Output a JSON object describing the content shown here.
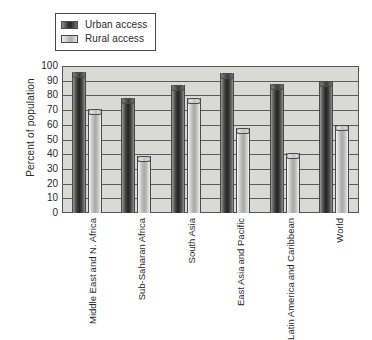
{
  "chart_data": {
    "type": "bar",
    "title": "",
    "subtitle": "",
    "xlabel": "",
    "ylabel": "Percent of population",
    "ylim": [
      0,
      100
    ],
    "ytick_step": 10,
    "yticks": [
      "100",
      "90",
      "80",
      "70",
      "60",
      "50",
      "40",
      "30",
      "20",
      "10",
      "0"
    ],
    "grid": true,
    "legend_position": "top-left",
    "categories": [
      "Middle East and N. Africa",
      "Sub-Saharan Africa",
      "South Asia",
      "East Asia and Pacific",
      "Latin America and Caribbean",
      "World"
    ],
    "category_label_lines": [
      [
        "Middle East",
        "and N. Africa"
      ],
      [
        "Sub-Saharan",
        "Africa"
      ],
      [
        "South Asia"
      ],
      [
        "East Asia",
        "and Pacific"
      ],
      [
        "Latin America",
        "and Caribbean"
      ],
      [
        "World"
      ]
    ],
    "series": [
      {
        "name": "Urban access",
        "color": "#2e2e2e",
        "values": [
          96,
          78,
          87,
          95,
          88,
          90
        ]
      },
      {
        "name": "Rural access",
        "color": "#c0c0c0",
        "values": [
          71,
          39,
          78,
          58,
          41,
          60
        ]
      }
    ]
  },
  "legend": {
    "items": [
      {
        "label": "Urban access",
        "swatch": "urban"
      },
      {
        "label": "Rural access",
        "swatch": "rural"
      }
    ]
  },
  "colors": {
    "plot_background": "#d9d9d5",
    "axis": "#555555",
    "gridline": "#5a5a5a",
    "page_background": "#ffffff",
    "text": "#2a2a2a"
  }
}
